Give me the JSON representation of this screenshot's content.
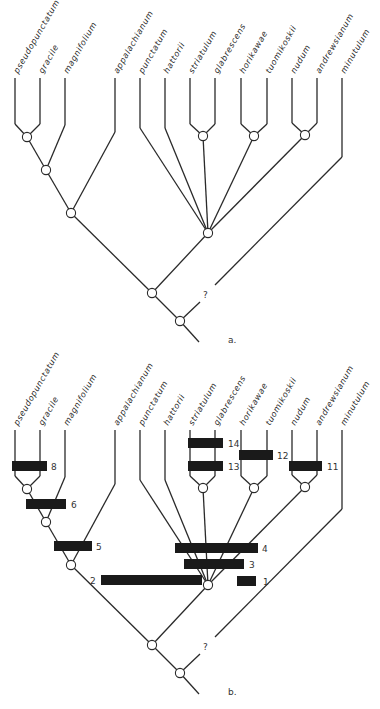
{
  "figure": {
    "taxa": [
      {
        "name": "pseudopunctatum",
        "x": 15
      },
      {
        "name": "gracile",
        "x": 40
      },
      {
        "name": "magnifolium",
        "x": 65
      },
      {
        "name": "appalachianum",
        "x": 115
      },
      {
        "name": "punctatum",
        "x": 140
      },
      {
        "name": "hattorii",
        "x": 165
      },
      {
        "name": "striatulum",
        "x": 190
      },
      {
        "name": "glabrescens",
        "x": 215
      },
      {
        "name": "horikawae",
        "x": 241
      },
      {
        "name": "tuomikoskii",
        "x": 267
      },
      {
        "name": "nudum",
        "x": 292
      },
      {
        "name": "andrewsianum",
        "x": 317
      },
      {
        "name": "minutulum",
        "x": 342
      }
    ],
    "panels": [
      {
        "label": "a.",
        "offset_y": 0,
        "question_mark": "?"
      },
      {
        "label": "b.",
        "offset_y": 352,
        "question_mark": "?"
      }
    ],
    "character_bars": [
      {
        "number": "1",
        "x": 237,
        "y": 581,
        "w": 19,
        "label_x": 263
      },
      {
        "number": "2",
        "x": 101,
        "y": 580,
        "w": 101,
        "label_x": 90
      },
      {
        "number": "3",
        "x": 184,
        "y": 564,
        "w": 60,
        "label_x": 249
      },
      {
        "number": "4",
        "x": 175,
        "y": 548,
        "w": 83,
        "label_x": 262
      },
      {
        "number": "5",
        "x": 54,
        "y": 546,
        "w": 38,
        "label_x": 96
      },
      {
        "number": "6",
        "x": 26,
        "y": 504,
        "w": 40,
        "label_x": 71
      },
      {
        "number": "8",
        "x": 12,
        "y": 466,
        "w": 35,
        "label_x": 51
      },
      {
        "number": "11",
        "x": 289,
        "y": 466,
        "w": 33,
        "label_x": 327
      },
      {
        "number": "12",
        "x": 239,
        "y": 455,
        "w": 34,
        "label_x": 277
      },
      {
        "number": "13",
        "x": 188,
        "y": 466,
        "w": 35,
        "label_x": 228
      },
      {
        "number": "14",
        "x": 188,
        "y": 443,
        "w": 35,
        "label_x": 228
      }
    ]
  }
}
